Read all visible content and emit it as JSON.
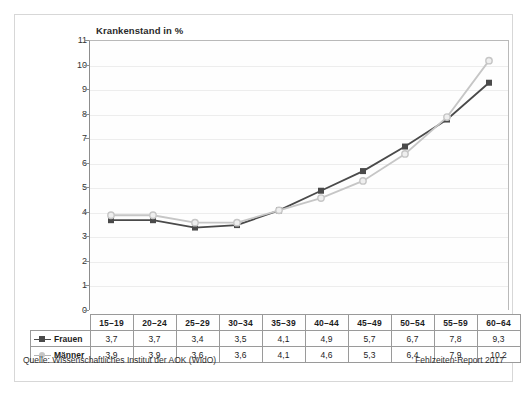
{
  "chart_data": {
    "type": "line",
    "title": "Krankenstand in %",
    "xlabel": "",
    "ylabel": "",
    "ylim": [
      0,
      11
    ],
    "yticks": [
      0,
      1,
      2,
      3,
      4,
      5,
      6,
      7,
      8,
      9,
      10,
      11
    ],
    "grid": true,
    "legend_position": "row-headers-left",
    "categories": [
      "15–19",
      "20–24",
      "25–29",
      "30–34",
      "35–39",
      "40–44",
      "45–49",
      "50–54",
      "55–59",
      "60–64"
    ],
    "series": [
      {
        "name": "Frauen",
        "color": "#4a4a4a",
        "marker": "square",
        "values": [
          3.7,
          3.7,
          3.4,
          3.5,
          4.1,
          4.9,
          5.7,
          6.7,
          7.8,
          9.3
        ],
        "labels": [
          "3,7",
          "3,7",
          "3,4",
          "3,5",
          "4,1",
          "4,9",
          "5,7",
          "6,7",
          "7,8",
          "9,3"
        ]
      },
      {
        "name": "Männer",
        "color": "#c6c6c6",
        "marker": "circle",
        "values": [
          3.9,
          3.9,
          3.6,
          3.6,
          4.1,
          4.6,
          5.3,
          6.4,
          7.9,
          10.2
        ],
        "labels": [
          "3,9",
          "3,9",
          "3,6",
          "3,6",
          "4,1",
          "4,6",
          "5,3",
          "6,4",
          "7,9",
          "10,2"
        ]
      }
    ]
  },
  "footer": {
    "source": "Quelle: Wissenschaftliches Institut der AOK (WIdO)",
    "report": "Fehlzeiten-Report 2017"
  }
}
